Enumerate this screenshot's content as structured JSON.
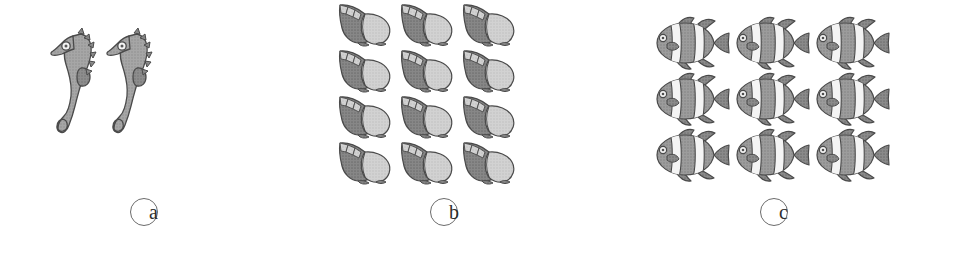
{
  "figure": {
    "background_color": "#ffffff",
    "style": "grayscale halftone clip-art",
    "panel_count": 3
  },
  "palette": {
    "outline": "#4a4a4a",
    "body_mid_gray": "#9a9a9a",
    "body_dark_gray": "#7d7d7d",
    "body_light_gray": "#c9c9c9",
    "highlight_white": "#f2f2f2",
    "label_stroke": "#6b6b6b",
    "label_text": "#2e2e2e"
  },
  "panels": [
    {
      "id": "a",
      "label": "a",
      "item_name": "seahorse",
      "item_icon": "seahorse-icon",
      "count": 2,
      "rows": 1,
      "columns": 2
    },
    {
      "id": "b",
      "label": "b",
      "item_name": "sea shell",
      "item_icon": "shell-icon",
      "count": 12,
      "rows": 4,
      "columns": 3
    },
    {
      "id": "c",
      "label": "c",
      "item_name": "clownfish",
      "item_icon": "clownfish-icon",
      "count": 9,
      "rows": 3,
      "columns": 3
    }
  ]
}
